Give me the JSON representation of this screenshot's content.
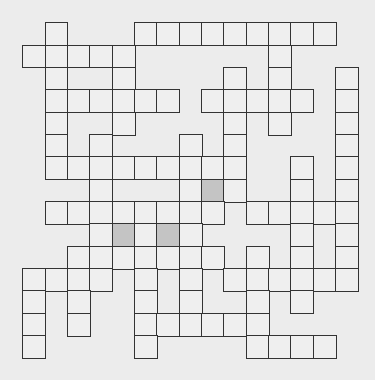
{
  "puzzle": {
    "type": "crossword-grid",
    "columns": 15,
    "rows": 15,
    "origin_x": 23,
    "origin_y": 23,
    "cell_size": 22.35,
    "colors": {
      "background": "#ececec",
      "cell": "#efefef",
      "shaded_cell": "#c4c4c4",
      "border": "#333333"
    },
    "grid_rows": [
      {
        "row": 0,
        "cols": [
          1,
          5,
          6,
          7,
          8,
          9,
          10,
          11,
          12,
          13
        ],
        "shaded": []
      },
      {
        "row": 1,
        "cols": [
          0,
          1,
          2,
          3,
          4,
          11
        ],
        "shaded": []
      },
      {
        "row": 2,
        "cols": [
          1,
          4,
          9,
          11,
          14
        ],
        "shaded": []
      },
      {
        "row": 3,
        "cols": [
          1,
          2,
          3,
          4,
          5,
          6,
          8,
          9,
          10,
          11,
          12,
          14
        ],
        "shaded": []
      },
      {
        "row": 4,
        "cols": [
          1,
          4,
          9,
          11,
          14
        ],
        "shaded": []
      },
      {
        "row": 5,
        "cols": [
          1,
          3,
          7,
          9,
          14
        ],
        "shaded": []
      },
      {
        "row": 6,
        "cols": [
          1,
          2,
          3,
          4,
          5,
          6,
          7,
          8,
          9,
          12,
          14
        ],
        "shaded": []
      },
      {
        "row": 7,
        "cols": [
          3,
          7,
          8,
          9,
          12,
          14
        ],
        "shaded": [
          8
        ]
      },
      {
        "row": 8,
        "cols": [
          1,
          2,
          3,
          4,
          5,
          6,
          7,
          8,
          10,
          11,
          12,
          13,
          14
        ],
        "shaded": []
      },
      {
        "row": 9,
        "cols": [
          3,
          4,
          5,
          6,
          7,
          12,
          14
        ],
        "shaded": [
          4,
          6
        ]
      },
      {
        "row": 10,
        "cols": [
          2,
          3,
          4,
          5,
          6,
          7,
          8,
          10,
          12,
          14
        ],
        "shaded": []
      },
      {
        "row": 11,
        "cols": [
          0,
          1,
          2,
          3,
          5,
          7,
          9,
          10,
          11,
          12,
          13,
          14
        ],
        "shaded": []
      },
      {
        "row": 12,
        "cols": [
          0,
          2,
          5,
          7,
          10,
          12
        ],
        "shaded": []
      },
      {
        "row": 13,
        "cols": [
          0,
          2,
          5,
          6,
          7,
          8,
          9,
          10
        ],
        "shaded": []
      },
      {
        "row": 14,
        "cols": [
          0,
          5,
          10,
          11,
          12,
          13
        ],
        "shaded": []
      }
    ]
  }
}
